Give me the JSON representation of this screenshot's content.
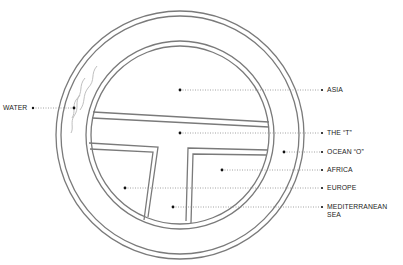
{
  "diagram": {
    "type": "T-O map",
    "colors": {
      "line": "#7a7a7a",
      "leader": "#8a8a8a",
      "dot": "#111111",
      "text": "#222222",
      "background": "#ffffff"
    },
    "labels": {
      "water": "WATER",
      "asia": "ASIA",
      "the_t": "THE “T”",
      "ocean_o": "OCEAN “O”",
      "africa": "AFRICA",
      "europe": "EUROPE",
      "mediterranean_line1": "MEDITERRANEAN",
      "mediterranean_line2": "SEA"
    }
  }
}
